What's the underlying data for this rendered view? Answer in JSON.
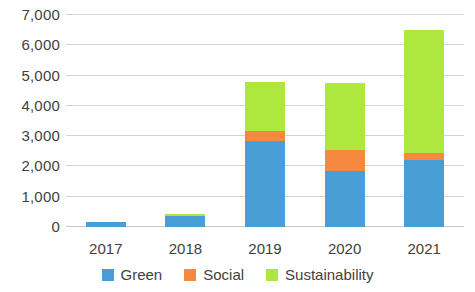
{
  "chart_data": {
    "type": "bar",
    "title": "",
    "subtitle": "",
    "xlabel": "",
    "ylabel": "",
    "stacked": true,
    "grid": true,
    "legend_position": "bottom",
    "categories": [
      "2017",
      "2018",
      "2019",
      "2020",
      "2021"
    ],
    "ylim": [
      0,
      7000
    ],
    "yticks": [
      0,
      1000,
      2000,
      3000,
      4000,
      5000,
      6000,
      7000
    ],
    "ytick_labels": [
      "0",
      "1,000",
      "2,000",
      "3,000",
      "4,000",
      "5,000",
      "6,000",
      "7,000"
    ],
    "series": [
      {
        "name": "Green",
        "color": "#4a9ed6",
        "values": [
          150,
          360,
          2850,
          1850,
          2200
        ]
      },
      {
        "name": "Social",
        "color": "#f5893f",
        "values": [
          0,
          0,
          330,
          700,
          230
        ]
      },
      {
        "name": "Sustainability",
        "color": "#aee83f",
        "values": [
          0,
          70,
          1620,
          2200,
          4070
        ]
      }
    ],
    "totals": [
      150,
      430,
      4800,
      4750,
      6500
    ]
  }
}
